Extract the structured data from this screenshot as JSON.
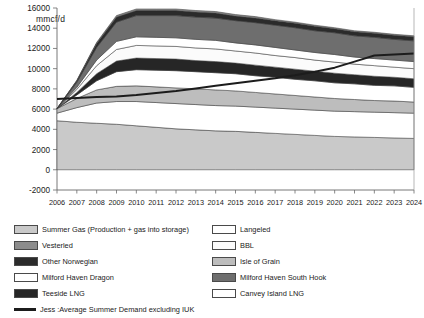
{
  "axis": {
    "y_unit_label": "mmcf/d",
    "y_ticks": [
      "16000",
      "14000",
      "12000",
      "10000",
      "8000",
      "6000",
      "4000",
      "2000",
      "0",
      "-2000"
    ],
    "x_ticks": [
      "2006",
      "2007",
      "2008",
      "2009",
      "2010",
      "2011",
      "2012",
      "2013",
      "2014",
      "2015",
      "2016",
      "2017",
      "2018",
      "2019",
      "2020",
      "2021",
      "2022",
      "2023",
      "2024"
    ]
  },
  "legend": {
    "left": [
      {
        "label": "Summer Gas (Production + gas into storage)",
        "color": "#c9c9c9",
        "type": "swatch"
      },
      {
        "label": "Vesterled",
        "color": "#8c8c8c",
        "type": "swatch"
      },
      {
        "label": "Other Norwegian",
        "color": "#2b2b2b",
        "type": "swatch"
      },
      {
        "label": "Milford Haven Dragon",
        "color": "#ffffff",
        "type": "swatch"
      },
      {
        "label": "Teeside LNG",
        "color": "#262626",
        "type": "swatch"
      },
      {
        "label": "Jess :Average Summer Demand excluding IUK",
        "color": "#1c1c1c",
        "type": "line"
      }
    ],
    "right": [
      {
        "label": "Langeled",
        "color": "#ffffff",
        "type": "swatch"
      },
      {
        "label": "BBL",
        "color": "#fbfbfb",
        "type": "swatch"
      },
      {
        "label": "Isle of Grain",
        "color": "#bdbdbd",
        "type": "swatch"
      },
      {
        "label": "Milford Haven South Hook",
        "color": "#6e6e6e",
        "type": "swatch"
      },
      {
        "label": "Canvey Island LNG",
        "color": "#ffffff",
        "type": "swatch"
      }
    ]
  },
  "chart_data": {
    "type": "area",
    "title": "",
    "xlabel": "",
    "ylabel": "mmcf/d",
    "ylim": [
      -2000,
      16000
    ],
    "ytick_step": 2000,
    "grid": false,
    "legend_position": "bottom",
    "stacked": true,
    "x": [
      "2006",
      "2007",
      "2008",
      "2009",
      "2010",
      "2011",
      "2012",
      "2013",
      "2014",
      "2015",
      "2016",
      "2017",
      "2018",
      "2019",
      "2020",
      "2021",
      "2022",
      "2023",
      "2024"
    ],
    "series": [
      {
        "name": "Summer Gas (Production + gas into storage)",
        "color": "#c9c9c9",
        "values": [
          4850,
          4700,
          4600,
          4500,
          4350,
          4200,
          4050,
          3950,
          3850,
          3800,
          3700,
          3600,
          3500,
          3400,
          3300,
          3250,
          3200,
          3150,
          3100
        ]
      },
      {
        "name": "Canvey Island LNG",
        "color": "#ffffff",
        "values": [
          750,
          1450,
          2000,
          2250,
          2400,
          2450,
          2500,
          2500,
          2500,
          2500,
          2500,
          2500,
          2500,
          2500,
          2500,
          2500,
          2500,
          2500,
          2500
        ]
      },
      {
        "name": "Isle of Grain",
        "color": "#bdbdbd",
        "values": [
          450,
          900,
          1300,
          1500,
          1550,
          1550,
          1550,
          1550,
          1550,
          1500,
          1450,
          1400,
          1350,
          1300,
          1250,
          1200,
          1150,
          1150,
          1100
        ]
      },
      {
        "name": "Milford Haven Dragon",
        "color": "#ffffff",
        "values": [
          0,
          350,
          900,
          1450,
          1600,
          1650,
          1700,
          1700,
          1700,
          1700,
          1650,
          1650,
          1600,
          1600,
          1550,
          1550,
          1500,
          1500,
          1450
        ]
      },
      {
        "name": "Teeside LNG",
        "color": "#262626",
        "values": [
          0,
          250,
          700,
          1050,
          1150,
          1150,
          1150,
          1100,
          1100,
          1050,
          1050,
          1000,
          1000,
          950,
          950,
          900,
          900,
          850,
          850
        ]
      },
      {
        "name": "BBL",
        "color": "#fbfbfb",
        "values": [
          0,
          300,
          800,
          1150,
          1250,
          1250,
          1250,
          1250,
          1250,
          1200,
          1200,
          1150,
          1150,
          1100,
          1100,
          1050,
          1050,
          1000,
          1000
        ]
      },
      {
        "name": "Langeled",
        "color": "#ffffff",
        "values": [
          0,
          200,
          550,
          800,
          850,
          850,
          850,
          850,
          850,
          800,
          800,
          800,
          750,
          750,
          750,
          700,
          700,
          700,
          700
        ]
      },
      {
        "name": "Milford Haven South Hook",
        "color": "#6e6e6e",
        "values": [
          0,
          500,
          1250,
          1900,
          2100,
          2150,
          2200,
          2200,
          2200,
          2200,
          2200,
          2200,
          2200,
          2150,
          2150,
          2100,
          2100,
          2050,
          2050
        ]
      },
      {
        "name": "Other Norwegian",
        "color": "#2b2b2b",
        "values": [
          0,
          150,
          400,
          500,
          500,
          500,
          500,
          500,
          500,
          450,
          450,
          450,
          450,
          450,
          400,
          400,
          400,
          400,
          400
        ],
        "note": "thin dark band at top of stack"
      },
      {
        "name": "Vesterled",
        "color": "#8c8c8c",
        "values": [
          0,
          50,
          100,
          150,
          150,
          150,
          150,
          150,
          150,
          150,
          150,
          100,
          100,
          100,
          100,
          100,
          100,
          100,
          100
        ]
      }
    ],
    "stack_totals": [
      6050,
      8850,
      11900,
      14250,
      13900,
      13900,
      13900,
      13750,
      13650,
      13350,
      13150,
      12850,
      12600,
      12300,
      12050,
      11750,
      11600,
      11400,
      11250
    ],
    "overlay_line": {
      "name": "Jess :Average Summer Demand excluding IUK",
      "color": "#1c1c1c",
      "style": "solid",
      "width": 2,
      "values": [
        7000,
        7100,
        7200,
        7250,
        7400,
        7600,
        7800,
        8050,
        8300,
        8550,
        8800,
        9050,
        9350,
        9700,
        10100,
        10700,
        11300,
        11400,
        11500
      ]
    }
  }
}
